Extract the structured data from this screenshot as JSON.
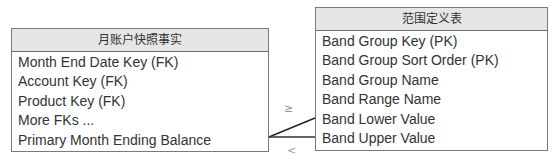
{
  "fact_table": {
    "title": "月账户快照事实",
    "fields": [
      "Month End Date Key (FK)",
      "Account Key (FK)",
      "Product Key (FK)",
      "More FKs ...",
      "Primary Month Ending Balance"
    ]
  },
  "band_table": {
    "title": "范围定义表",
    "fields": [
      "Band Group Key (PK)",
      "Band Group Sort Order (PK)",
      "Band Group Name",
      "Band Range Name",
      "Band Lower Value",
      "Band Upper Value"
    ]
  },
  "join": {
    "upper_symbol": "≥",
    "lower_symbol": "<"
  },
  "colors": {
    "header_bg": "#e6e6e6",
    "border": "#7a7a7a",
    "line": "#222222"
  }
}
